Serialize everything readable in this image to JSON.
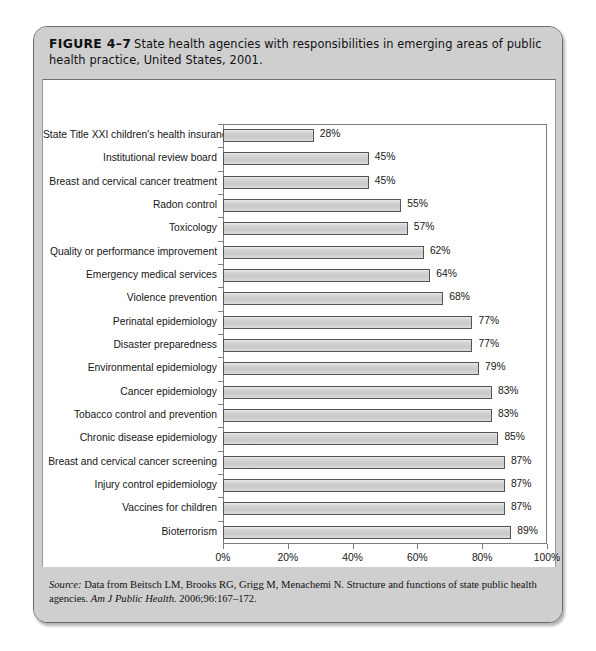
{
  "figure": {
    "number_label": "FIGURE 4–7",
    "caption": "State health agencies with responsibilities in emerging areas of public health practice, United States, 2001."
  },
  "source": {
    "label": "Source:",
    "line1": " Data from Beitsch LM, Brooks RG, Grigg M, Menachemi N. Structure and functions of state public health agencies. ",
    "journal": "Am J Public Health.",
    "citation": " 2006;96:167–172."
  },
  "chart_data": {
    "type": "bar",
    "orientation": "horizontal",
    "title": "State health agencies with responsibilities in emerging areas of public health practice, United States, 2001",
    "xlabel": "",
    "ylabel": "",
    "xlim": [
      0,
      100
    ],
    "grid": false,
    "legend": null,
    "x_tick_labels": [
      "0%",
      "20%",
      "40%",
      "60%",
      "80%",
      "100%"
    ],
    "x_tick_values": [
      0,
      20,
      40,
      60,
      80,
      100
    ],
    "value_suffix": "%",
    "bar_color": "#d2d2d2",
    "bar_border_color": "#545454",
    "categories": [
      "State Title XXI children's health insurance",
      "Institutional review board",
      "Breast and cervical cancer treatment",
      "Radon control",
      "Toxicology",
      "Quality or performance improvement",
      "Emergency medical services",
      "Violence prevention",
      "Perinatal epidemiology",
      "Disaster preparedness",
      "Environmental epidemiology",
      "Cancer epidemiology",
      "Tobacco control and prevention",
      "Chronic disease epidemiology",
      "Breast and cervical cancer screening",
      "Injury control epidemiology",
      "Vaccines for children",
      "Bioterrorism"
    ],
    "values": [
      28,
      45,
      45,
      55,
      57,
      62,
      64,
      68,
      77,
      77,
      79,
      83,
      83,
      85,
      87,
      87,
      87,
      89
    ],
    "value_labels": [
      "28%",
      "45%",
      "45%",
      "55%",
      "57%",
      "62%",
      "64%",
      "68%",
      "77%",
      "77%",
      "79%",
      "83%",
      "83%",
      "85%",
      "87%",
      "87%",
      "87%",
      "89%"
    ]
  }
}
